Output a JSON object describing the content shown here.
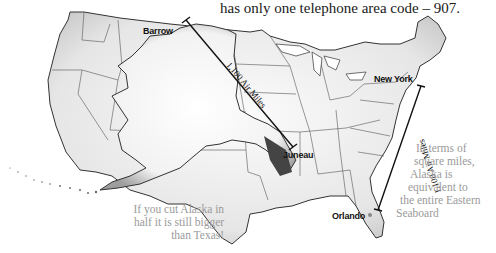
{
  "headline": "has only one telephone area code – 907.",
  "cities": {
    "barrow": "Barrow",
    "juneau": "Juneau",
    "new_york": "New York",
    "orlando": "Orlando"
  },
  "distances": {
    "alaska_span": "1,100 Air Miles",
    "east_coast_span": "1,100 Air Miles"
  },
  "notes": {
    "left_lines": [
      "If you cut Alaska in",
      "half it is still bigger",
      "than Texas!"
    ],
    "right_lines": [
      "In terms of",
      "square miles,",
      "Alaska is",
      "equivalent to",
      "the entire Eastern",
      "Seaboard"
    ]
  },
  "colors": {
    "state_fill": "#eeeeee",
    "state_stroke": "#333333",
    "alaska_fill": "#f7f7f7",
    "note_text": "#9a9a9a",
    "measure_line": "#111111"
  }
}
